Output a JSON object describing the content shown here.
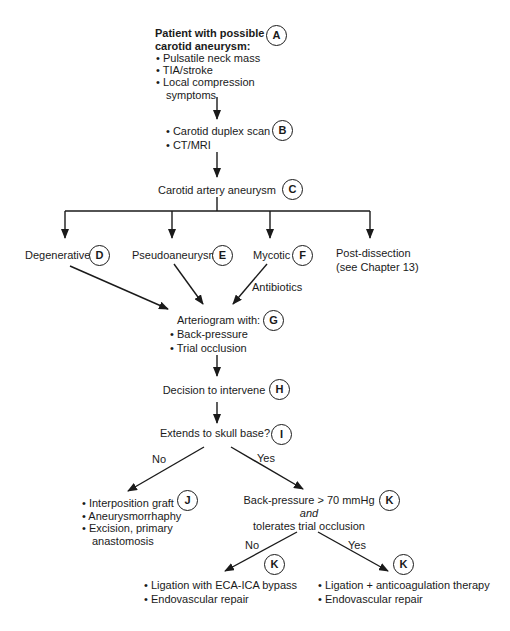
{
  "nodes": {
    "a": {
      "letter": "A",
      "title_lines": [
        "Patient with possible",
        "carotid aneurysm:"
      ],
      "bullets": [
        "Pulsatile neck mass",
        "TIA/stroke",
        "Local compression symptoms"
      ]
    },
    "b": {
      "letter": "B",
      "bullets": [
        "Carotid duplex scan",
        "CT/MRI"
      ]
    },
    "c": {
      "letter": "C",
      "label": "Carotid artery aneurysm"
    },
    "d": {
      "letter": "D",
      "label": "Degenerative"
    },
    "e": {
      "letter": "E",
      "label": "Pseudoaneurysm"
    },
    "f": {
      "letter": "F",
      "label": "Mycotic"
    },
    "post_dissection": {
      "line1": "Post-dissection",
      "line2": "(see Chapter 13)"
    },
    "g": {
      "letter": "G",
      "title": "Arteriogram with:",
      "bullets": [
        "Back-pressure",
        "Trial occlusion"
      ]
    },
    "h": {
      "letter": "H",
      "label": "Decision to intervene"
    },
    "i": {
      "letter": "I",
      "label": "Extends to skull base?"
    },
    "j": {
      "letter": "J",
      "bullets": [
        "Interposition graft",
        "Aneurysmorrhaphy",
        "Excision, primary anastomosis"
      ]
    },
    "k1": {
      "letter": "K",
      "line1": "Back-pressure > 70 mmHg",
      "line2": "and",
      "line3": "tolerates trial occlusion"
    },
    "k2": {
      "letter": "K",
      "bullets": [
        "Ligation with ECA-ICA bypass",
        "Endovascular repair"
      ]
    },
    "k3": {
      "letter": "K",
      "bullets": [
        "Ligation + anticoagulation therapy",
        "Endovascular repair"
      ]
    }
  },
  "edge_labels": {
    "antibiotics": "Antibiotics",
    "skull_no": "No",
    "skull_yes": "Yes",
    "pressure_no": "No",
    "pressure_yes": "Yes"
  },
  "colors": {
    "ink": "#1a1a1a",
    "background": "#ffffff"
  }
}
